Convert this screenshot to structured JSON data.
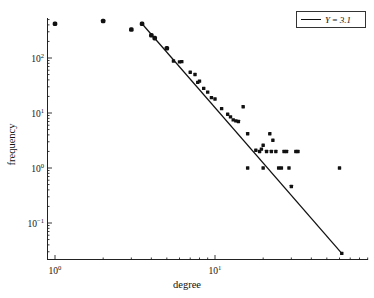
{
  "chart_data": {
    "type": "scatter",
    "title": "",
    "xlabel": "degree",
    "ylabel": "frequency",
    "xscale": "log",
    "yscale": "log",
    "xlim": [
      0.85,
      70
    ],
    "ylim": [
      0.02,
      700
    ],
    "grid": false,
    "legend_position": "top-right",
    "xticks": [
      "10⁰",
      "10¹"
    ],
    "xtick_values": [
      1,
      10
    ],
    "yticks": [
      "10²",
      "10¹",
      "10⁰",
      "10⁻¹"
    ],
    "ytick_values": [
      100,
      10,
      1,
      0.1
    ],
    "series": [
      {
        "name": "degree distribution",
        "marker": "square",
        "color": "#111111",
        "points": [
          [
            1,
            420
          ],
          [
            2,
            470
          ],
          [
            3,
            330
          ],
          [
            3.5,
            420
          ],
          [
            4,
            260
          ],
          [
            4.2,
            230
          ],
          [
            5,
            150
          ],
          [
            5.5,
            88
          ],
          [
            6,
            85
          ],
          [
            6.2,
            86
          ],
          [
            7,
            55
          ],
          [
            7.5,
            50
          ],
          [
            7.8,
            36
          ],
          [
            8,
            38
          ],
          [
            8.5,
            28
          ],
          [
            9,
            24
          ],
          [
            9.5,
            19
          ],
          [
            10,
            18
          ],
          [
            11,
            12
          ],
          [
            12,
            9.5
          ],
          [
            12.5,
            8.5
          ],
          [
            13,
            7.5
          ],
          [
            13.5,
            7.2
          ],
          [
            14,
            7.0
          ],
          [
            15,
            13
          ],
          [
            16,
            4.2
          ],
          [
            16,
            1
          ],
          [
            18,
            2.1
          ],
          [
            19,
            2.0
          ],
          [
            19.5,
            2.2
          ],
          [
            20,
            2.6
          ],
          [
            20,
            1
          ],
          [
            21,
            2.0
          ],
          [
            22,
            4.2
          ],
          [
            22.5,
            2.0
          ],
          [
            23,
            3.2
          ],
          [
            24,
            2.0
          ],
          [
            25,
            1
          ],
          [
            26,
            1
          ],
          [
            27,
            2.0
          ],
          [
            28,
            2.0
          ],
          [
            29,
            1
          ],
          [
            30,
            0.46
          ],
          [
            32,
            2.0
          ],
          [
            33,
            2.0
          ],
          [
            60,
            1
          ],
          [
            62,
            0.028
          ]
        ]
      }
    ],
    "fit_line": {
      "label": "Y = 3.1",
      "exponent": 3.1,
      "x_start": 3.5,
      "y_start": 420,
      "x_end": 62,
      "y_end": 0.028,
      "color": "#111111"
    }
  },
  "legend": {
    "entries": [
      {
        "label": "Y = 3.1",
        "swatch": "line",
        "color": "#111111"
      }
    ]
  },
  "axes": {
    "x_title": "degree",
    "y_title": "frequency",
    "x_tick_labels": [
      {
        "mantissa": "10",
        "exponent": "0"
      },
      {
        "mantissa": "10",
        "exponent": "1"
      }
    ],
    "y_tick_labels": [
      {
        "mantissa": "10",
        "exponent": "2"
      },
      {
        "mantissa": "10",
        "exponent": "1"
      },
      {
        "mantissa": "10",
        "exponent": "0"
      },
      {
        "mantissa": "10",
        "exponent": "-1"
      }
    ]
  }
}
